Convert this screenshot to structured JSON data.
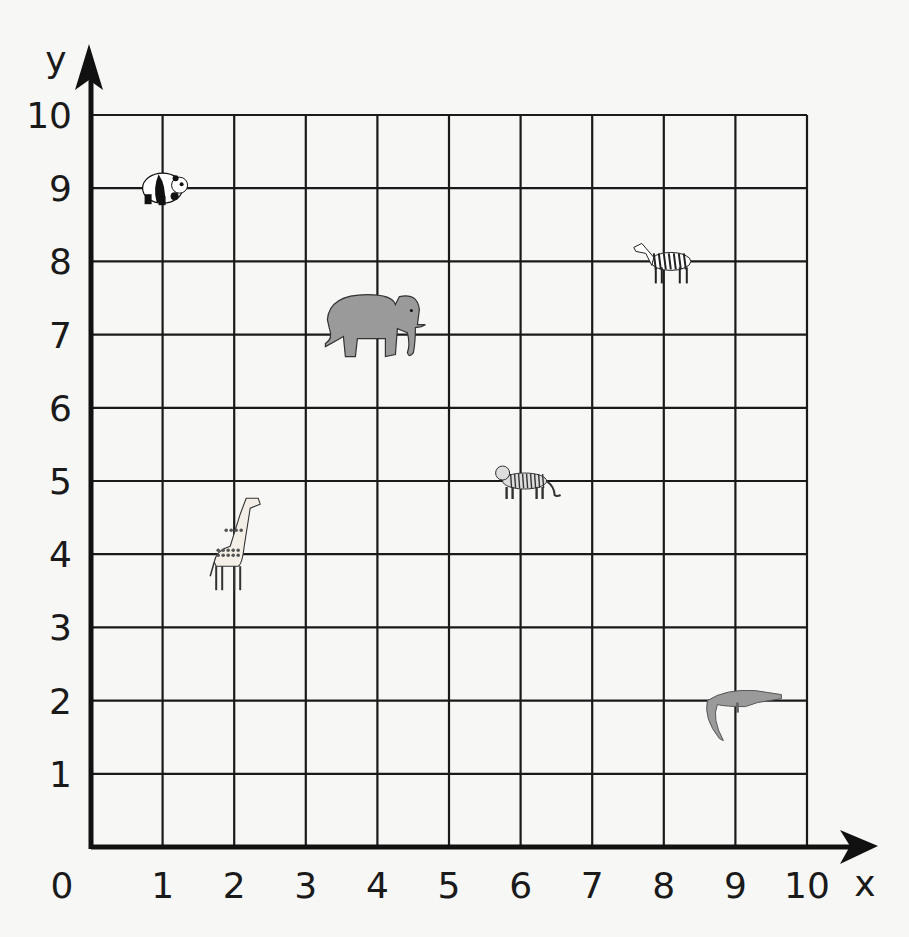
{
  "axes": {
    "x_label": "x",
    "y_label": "y",
    "x_ticks": [
      "0",
      "1",
      "2",
      "3",
      "4",
      "5",
      "6",
      "7",
      "8",
      "9",
      "10"
    ],
    "y_ticks": [
      "1",
      "2",
      "3",
      "4",
      "5",
      "6",
      "7",
      "8",
      "9",
      "10"
    ],
    "origin_label": "0"
  },
  "colors": {
    "background": "#f7f7f5",
    "grid": "#1a1a1a",
    "axis": "#111111",
    "animal_gray": "#9a9a9a"
  },
  "animals": [
    {
      "name": "panda",
      "x": 1,
      "y": 9,
      "icon": "panda-icon"
    },
    {
      "name": "zebra",
      "x": 8,
      "y": 8,
      "icon": "zebra-icon"
    },
    {
      "name": "elephant",
      "x": 4,
      "y": 7,
      "icon": "elephant-icon"
    },
    {
      "name": "tiger",
      "x": 6,
      "y": 5,
      "icon": "tiger-icon"
    },
    {
      "name": "giraffe",
      "x": 2,
      "y": 4,
      "icon": "giraffe-icon"
    },
    {
      "name": "crocodile",
      "x": 9,
      "y": 2,
      "icon": "crocodile-icon"
    }
  ],
  "chart_data": {
    "type": "scatter",
    "title": "",
    "xlabel": "x",
    "ylabel": "y",
    "xlim": [
      0,
      10
    ],
    "ylim": [
      0,
      10
    ],
    "grid": true,
    "x_ticks": [
      0,
      1,
      2,
      3,
      4,
      5,
      6,
      7,
      8,
      9,
      10
    ],
    "y_ticks": [
      1,
      2,
      3,
      4,
      5,
      6,
      7,
      8,
      9,
      10
    ],
    "points": [
      {
        "label": "panda",
        "x": 1,
        "y": 9
      },
      {
        "label": "zebra",
        "x": 8,
        "y": 8
      },
      {
        "label": "elephant",
        "x": 4,
        "y": 7
      },
      {
        "label": "tiger",
        "x": 6,
        "y": 5
      },
      {
        "label": "giraffe",
        "x": 2,
        "y": 4
      },
      {
        "label": "crocodile",
        "x": 9,
        "y": 2
      }
    ]
  }
}
